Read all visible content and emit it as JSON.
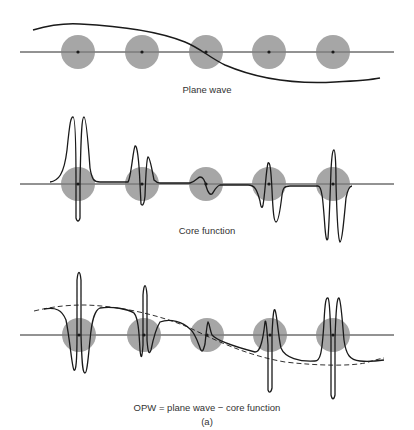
{
  "figure": {
    "colors": {
      "background": "#ffffff",
      "atom_fill": "#a6a6a6",
      "axis_line": "#555555",
      "curve": "#1a1a1a",
      "nucleus": "#1a1a1a"
    },
    "atom_positions_x": [
      78,
      142,
      206,
      269,
      333
    ],
    "atom_radius": 17,
    "panels": [
      {
        "id": "plane-wave",
        "label": "Plane wave",
        "axis_y": 52,
        "label_y": 85
      },
      {
        "id": "core-function",
        "label": "Core function",
        "axis_y": 184,
        "label_y": 225
      },
      {
        "id": "opw",
        "label": "OPW = plane wave − core function",
        "axis_y": 335,
        "label_y": 404
      }
    ],
    "caption": "(a)"
  }
}
